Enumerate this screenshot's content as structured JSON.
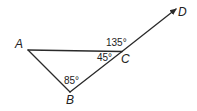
{
  "diagram": {
    "type": "geometry-triangle-with-extended-side",
    "points": {
      "A": {
        "label": "A"
      },
      "B": {
        "label": "B"
      },
      "C": {
        "label": "C"
      },
      "D": {
        "label": "D"
      }
    },
    "angles": {
      "exterior_ACD": "135°",
      "interior_ACB": "45°",
      "interior_ABC": "85°"
    },
    "segments": [
      "AC",
      "AB",
      "BC",
      "CD (ray, arrow to D)"
    ],
    "colors": {
      "stroke": "#2a2a2a",
      "text": "#222222",
      "background": "#ffffff"
    }
  }
}
